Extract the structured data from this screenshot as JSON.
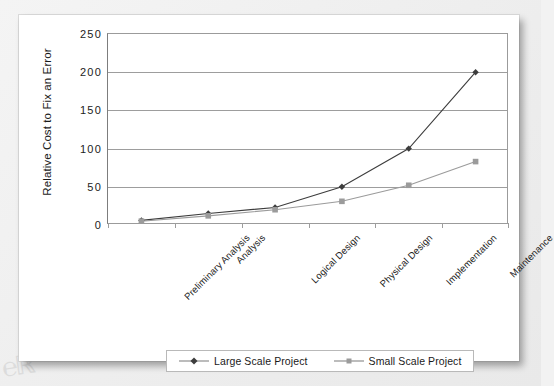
{
  "chart_data": {
    "type": "line",
    "title": "",
    "xlabel": "",
    "ylabel": "Relative Cost to Fix an Error",
    "ylim": [
      0,
      250
    ],
    "yticks": [
      "0",
      "50",
      "100",
      "150",
      "200",
      "250"
    ],
    "grid": true,
    "legend_position": "bottom",
    "categories": [
      "Preliminary Analysis",
      "Analysis",
      "Logical Design",
      "Physical Design",
      "Implementation",
      "Maintenance"
    ],
    "series": [
      {
        "name": "Large Scale Project",
        "marker": "diamond",
        "color": "#3d3d3d",
        "values": [
          6,
          15,
          23,
          50,
          100,
          200
        ]
      },
      {
        "name": "Small Scale Project",
        "marker": "square",
        "color": "#9b9b9b",
        "values": [
          5,
          12,
          20,
          31,
          52,
          83
        ]
      }
    ]
  },
  "legend": {
    "entries": [
      {
        "label": "Large Scale Project"
      },
      {
        "label": "Small Scale Project"
      }
    ]
  },
  "colors": {
    "page_background": "#f2f2f2",
    "card_background": "#ffffff",
    "axis": "#9b9b9b",
    "gridline": "#9d9d9d",
    "large_series": "#3d3d3d",
    "small_series": "#9b9b9b",
    "text": "#1a1a1a"
  }
}
